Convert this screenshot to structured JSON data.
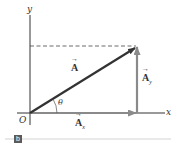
{
  "diagram": {
    "axes": {
      "x_label": "x",
      "y_label": "y",
      "origin_label": "O"
    },
    "vectors": {
      "A": {
        "label": "A",
        "arrow": "→"
      },
      "Ax": {
        "label": "A",
        "subscript": "x",
        "arrow": "→"
      },
      "Ay": {
        "label": "A",
        "subscript": "y",
        "arrow": "→"
      }
    },
    "angle_label": "θ",
    "panel_label": "b",
    "colors": {
      "axis": "#333333",
      "vector_A": "#333333",
      "components": "#8a8a8a",
      "dashed": "#444444",
      "rule": "#c8c8c8"
    }
  }
}
